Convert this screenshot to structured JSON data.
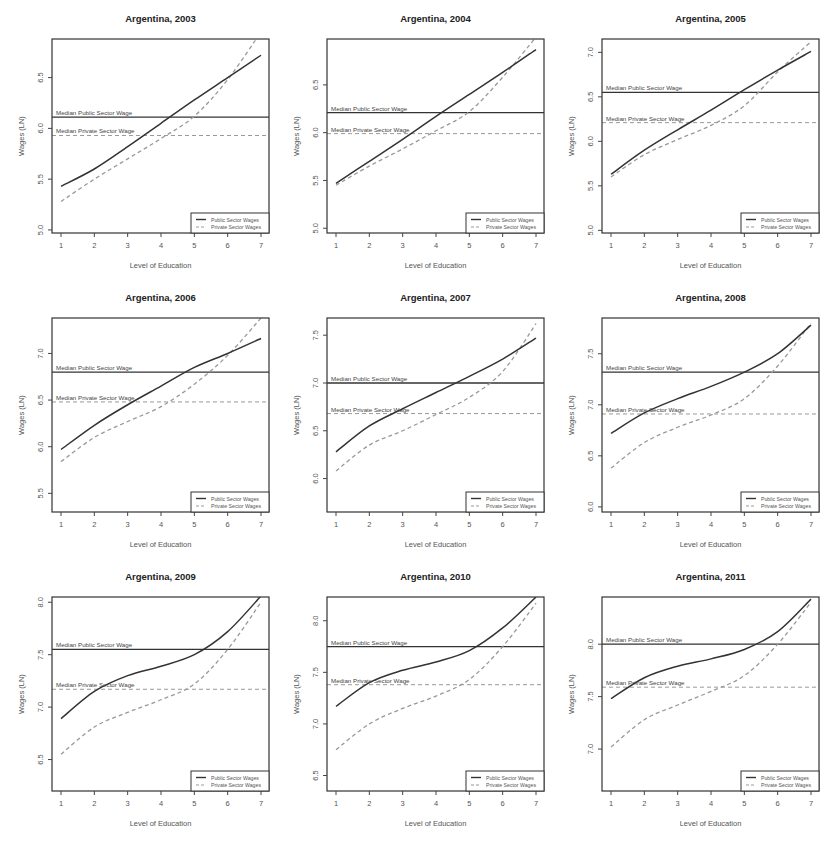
{
  "figure": {
    "xlabel": "Level of Education",
    "ylabel": "Wages (LN)",
    "median_public_label": "Median Public Sector Wage",
    "median_private_label": "Median Private Sector Wage",
    "legend": [
      "Public Sector Wages",
      "Private Sector Wages"
    ],
    "colors": {
      "public": "#333333",
      "private": "#999999",
      "frame": "#333333"
    }
  },
  "chart_data": [
    {
      "type": "line",
      "title": "Argentina, 2003",
      "xlabel": "Level of Education",
      "ylabel": "Wages (LN)",
      "x": [
        1,
        2,
        3,
        4,
        5,
        6,
        7
      ],
      "ylim": [
        4.97,
        6.88
      ],
      "yticks": [
        5.0,
        5.5,
        6.0,
        6.5
      ],
      "series": [
        {
          "name": "Public Sector Wages",
          "style": "solid",
          "values": [
            5.43,
            5.6,
            5.82,
            6.05,
            6.28,
            6.5,
            6.72
          ]
        },
        {
          "name": "Private Sector Wages",
          "style": "dashed",
          "values": [
            5.28,
            5.5,
            5.7,
            5.9,
            6.12,
            6.48,
            6.95
          ]
        }
      ],
      "median_public": 6.11,
      "median_private": 5.93,
      "legend_position": "bottomright",
      "grid": false
    },
    {
      "type": "line",
      "title": "Argentina, 2004",
      "xlabel": "Level of Education",
      "ylabel": "Wages (LN)",
      "x": [
        1,
        2,
        3,
        4,
        5,
        6,
        7
      ],
      "ylim": [
        4.95,
        6.98
      ],
      "yticks": [
        5.0,
        5.5,
        6.0,
        6.5
      ],
      "series": [
        {
          "name": "Public Sector Wages",
          "style": "solid",
          "values": [
            5.47,
            5.7,
            5.93,
            6.17,
            6.4,
            6.63,
            6.87
          ]
        },
        {
          "name": "Private Sector Wages",
          "style": "dashed",
          "values": [
            5.45,
            5.65,
            5.83,
            6.02,
            6.22,
            6.58,
            7.0
          ]
        }
      ],
      "median_public": 6.21,
      "median_private": 5.99,
      "legend_position": "bottomright",
      "grid": false
    },
    {
      "type": "line",
      "title": "Argentina, 2005",
      "xlabel": "Level of Education",
      "ylabel": "Wages (LN)",
      "x": [
        1,
        2,
        3,
        4,
        5,
        6,
        7
      ],
      "ylim": [
        4.97,
        7.15
      ],
      "yticks": [
        5.0,
        5.5,
        6.0,
        6.5,
        7.0
      ],
      "series": [
        {
          "name": "Public Sector Wages",
          "style": "solid",
          "values": [
            5.63,
            5.9,
            6.13,
            6.35,
            6.58,
            6.8,
            7.01
          ]
        },
        {
          "name": "Private Sector Wages",
          "style": "dashed",
          "values": [
            5.6,
            5.85,
            6.02,
            6.18,
            6.4,
            6.78,
            7.12
          ]
        }
      ],
      "median_public": 6.55,
      "median_private": 6.21,
      "legend_position": "bottomright",
      "grid": false
    },
    {
      "type": "line",
      "title": "Argentina, 2006",
      "xlabel": "Level of Education",
      "ylabel": "Wages (LN)",
      "x": [
        1,
        2,
        3,
        4,
        5,
        6,
        7
      ],
      "ylim": [
        5.3,
        7.38
      ],
      "yticks": [
        5.5,
        6.0,
        6.5,
        7.0
      ],
      "series": [
        {
          "name": "Public Sector Wages",
          "style": "solid",
          "values": [
            5.97,
            6.23,
            6.45,
            6.65,
            6.85,
            7.0,
            7.16
          ]
        },
        {
          "name": "Private Sector Wages",
          "style": "dashed",
          "values": [
            5.84,
            6.1,
            6.27,
            6.43,
            6.67,
            6.98,
            7.38
          ]
        }
      ],
      "median_public": 6.8,
      "median_private": 6.48,
      "legend_position": "bottomright",
      "grid": false
    },
    {
      "type": "line",
      "title": "Argentina, 2007",
      "xlabel": "Level of Education",
      "ylabel": "Wages (LN)",
      "x": [
        1,
        2,
        3,
        4,
        5,
        6,
        7
      ],
      "ylim": [
        5.65,
        7.68
      ],
      "yticks": [
        6.0,
        6.5,
        7.0,
        7.5
      ],
      "series": [
        {
          "name": "Public Sector Wages",
          "style": "solid",
          "values": [
            6.28,
            6.55,
            6.73,
            6.9,
            7.07,
            7.25,
            7.47
          ]
        },
        {
          "name": "Private Sector Wages",
          "style": "dashed",
          "values": [
            6.08,
            6.35,
            6.5,
            6.67,
            6.85,
            7.12,
            7.62
          ]
        }
      ],
      "median_public": 7.0,
      "median_private": 6.68,
      "legend_position": "bottomright",
      "grid": false
    },
    {
      "type": "line",
      "title": "Argentina, 2008",
      "xlabel": "Level of Education",
      "ylabel": "Wages (LN)",
      "x": [
        1,
        2,
        3,
        4,
        5,
        6,
        7
      ],
      "ylim": [
        5.95,
        7.85
      ],
      "yticks": [
        6.0,
        6.5,
        7.0,
        7.5
      ],
      "series": [
        {
          "name": "Public Sector Wages",
          "style": "solid",
          "values": [
            6.72,
            6.92,
            7.06,
            7.18,
            7.32,
            7.5,
            7.78
          ]
        },
        {
          "name": "Private Sector Wages",
          "style": "dashed",
          "values": [
            6.38,
            6.63,
            6.78,
            6.9,
            7.06,
            7.38,
            7.8
          ]
        }
      ],
      "median_public": 7.32,
      "median_private": 6.91,
      "legend_position": "bottomright",
      "grid": false
    },
    {
      "type": "line",
      "title": "Argentina, 2009",
      "xlabel": "Level of Education",
      "ylabel": "Wages (LN)",
      "x": [
        1,
        2,
        3,
        4,
        5,
        6,
        7
      ],
      "ylim": [
        6.2,
        8.05
      ],
      "yticks": [
        6.5,
        7.0,
        7.5,
        8.0
      ],
      "series": [
        {
          "name": "Public Sector Wages",
          "style": "solid",
          "values": [
            6.89,
            7.15,
            7.3,
            7.39,
            7.5,
            7.72,
            8.06
          ]
        },
        {
          "name": "Private Sector Wages",
          "style": "dashed",
          "values": [
            6.55,
            6.81,
            6.95,
            7.07,
            7.22,
            7.55,
            8.0
          ]
        }
      ],
      "median_public": 7.55,
      "median_private": 7.17,
      "legend_position": "bottomright",
      "grid": false
    },
    {
      "type": "line",
      "title": "Argentina, 2010",
      "xlabel": "Level of Education",
      "ylabel": "Wages (LN)",
      "x": [
        1,
        2,
        3,
        4,
        5,
        6,
        7
      ],
      "ylim": [
        6.35,
        8.23
      ],
      "yticks": [
        6.5,
        7.0,
        7.5,
        8.0
      ],
      "series": [
        {
          "name": "Public Sector Wages",
          "style": "solid",
          "values": [
            7.17,
            7.4,
            7.52,
            7.6,
            7.71,
            7.93,
            8.23
          ]
        },
        {
          "name": "Private Sector Wages",
          "style": "dashed",
          "values": [
            6.75,
            7.0,
            7.15,
            7.27,
            7.43,
            7.75,
            8.17
          ]
        }
      ],
      "median_public": 7.75,
      "median_private": 7.38,
      "legend_position": "bottomright",
      "grid": false
    },
    {
      "type": "line",
      "title": "Argentina, 2011",
      "xlabel": "Level of Education",
      "ylabel": "Wages (LN)",
      "x": [
        1,
        2,
        3,
        4,
        5,
        6,
        7
      ],
      "ylim": [
        6.6,
        8.45
      ],
      "yticks": [
        7.0,
        7.5,
        8.0
      ],
      "series": [
        {
          "name": "Public Sector Wages",
          "style": "solid",
          "values": [
            7.48,
            7.68,
            7.79,
            7.86,
            7.95,
            8.12,
            8.43
          ]
        },
        {
          "name": "Private Sector Wages",
          "style": "dashed",
          "values": [
            7.02,
            7.28,
            7.42,
            7.55,
            7.7,
            8.0,
            8.4
          ]
        }
      ],
      "median_public": 8.0,
      "median_private": 7.59,
      "legend_position": "bottomright",
      "grid": false
    }
  ]
}
